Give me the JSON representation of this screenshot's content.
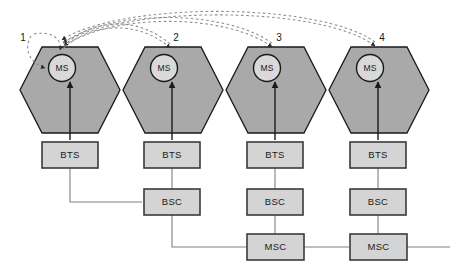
{
  "diagram": {
    "type": "network-diagram",
    "colors": {
      "cell_fill": "#a9a9a9",
      "cell_stroke": "#1a1a1a",
      "ms_fill": "#d9d9d9",
      "ms_stroke": "#1a1a1a",
      "box_fill": "#d4d4d4",
      "box_stroke": "#3a3a3a",
      "line": "#808080",
      "arrow": "#1a1a1a",
      "dashed": "#8c8c8c",
      "background": "#ffffff"
    }
  },
  "cells": [
    {
      "number": "1",
      "ms_label": "MS",
      "bts_label": "BTS",
      "bsc_label": "",
      "msc_label": "",
      "center_x": 70
    },
    {
      "number": "2",
      "ms_label": "MS",
      "bts_label": "BTS",
      "bsc_label": "BSC",
      "msc_label": "",
      "center_x": 172
    },
    {
      "number": "3",
      "ms_label": "MS",
      "bts_label": "BTS",
      "bsc_label": "BSC",
      "msc_label": "MSC",
      "center_x": 275
    },
    {
      "number": "4",
      "ms_label": "MS",
      "bts_label": "BTS",
      "bsc_label": "BSC",
      "msc_label": "MSC",
      "center_x": 378
    }
  ],
  "labels": {
    "ms": "MS",
    "bts": "BTS",
    "bsc": "BSC",
    "msc": "MSC",
    "cell_1": "1",
    "cell_2": "2",
    "cell_3": "3",
    "cell_4": "4"
  },
  "handover_arcs": [
    {
      "name": "intra-cell-handover",
      "from": "cell-1",
      "to": "cell-1"
    },
    {
      "name": "inter-cell-intra-bsc-handover",
      "from": "cell-1",
      "to": "cell-2"
    },
    {
      "name": "inter-bsc-intra-msc-handover",
      "from": "cell-1",
      "to": "cell-3"
    },
    {
      "name": "inter-msc-handover",
      "from": "cell-1",
      "to": "cell-4"
    }
  ]
}
